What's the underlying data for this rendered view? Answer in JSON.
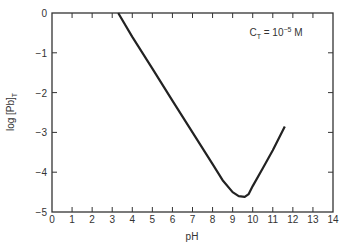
{
  "chart_data": {
    "type": "line",
    "title": "",
    "annotation": {
      "main": "C",
      "sub": "T",
      "rest": " = 10",
      "exp": "−5",
      "unit": " M"
    },
    "xlabel": "pH",
    "ylabel": "log [Pb]",
    "ylabel_sub": "T",
    "xlim": [
      0,
      14
    ],
    "ylim": [
      -5,
      0
    ],
    "xticks": [
      "0",
      "1",
      "2",
      "3",
      "4",
      "5",
      "6",
      "7",
      "8",
      "9",
      "10",
      "11",
      "12",
      "13",
      "14"
    ],
    "yticks": [
      "0",
      "−1",
      "−2",
      "−3",
      "−4",
      "−5"
    ],
    "grid": false,
    "series": [
      {
        "name": "log [Pb]T",
        "x": [
          3.3,
          4,
          5,
          6,
          7,
          8,
          8.5,
          9,
          9.3,
          9.6,
          9.8,
          10,
          10.5,
          11,
          11.6
        ],
        "y": [
          0,
          -0.6,
          -1.4,
          -2.2,
          -3.0,
          -3.8,
          -4.2,
          -4.5,
          -4.6,
          -4.62,
          -4.55,
          -4.35,
          -3.9,
          -3.45,
          -2.85
        ]
      }
    ]
  }
}
